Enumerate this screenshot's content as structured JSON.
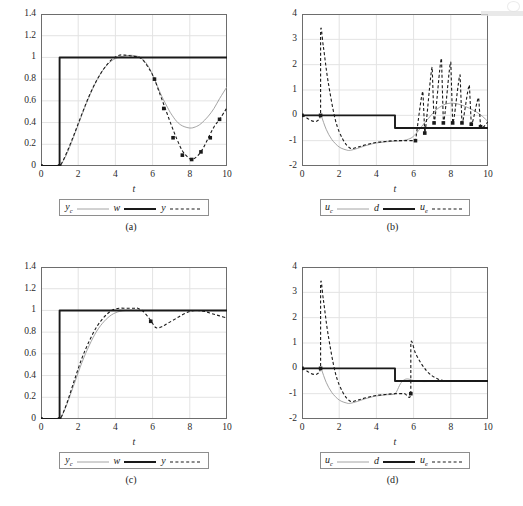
{
  "figure": {
    "panels": [
      {
        "caption": "(a)",
        "xlabel": "t",
        "legend": [
          {
            "label": "y",
            "sub": "c",
            "style": "thin-gray-solid"
          },
          {
            "label": "w",
            "sub": "",
            "style": "thick-black-solid"
          },
          {
            "label": "y",
            "sub": "",
            "style": "black-dashed"
          }
        ]
      },
      {
        "caption": "(b)",
        "xlabel": "t",
        "legend": [
          {
            "label": "u",
            "sub": "c",
            "style": "thin-gray-solid"
          },
          {
            "label": "d",
            "sub": "",
            "style": "thick-black-solid"
          },
          {
            "label": "u",
            "sub": "e",
            "style": "black-dashed"
          }
        ]
      },
      {
        "caption": "(c)",
        "xlabel": "t",
        "legend": [
          {
            "label": "y",
            "sub": "c",
            "style": "thin-gray-solid"
          },
          {
            "label": "w",
            "sub": "",
            "style": "thick-black-solid"
          },
          {
            "label": "y",
            "sub": "",
            "style": "black-dashed"
          }
        ]
      },
      {
        "caption": "(d)",
        "xlabel": "t",
        "legend": [
          {
            "label": "u",
            "sub": "c",
            "style": "thin-gray-solid"
          },
          {
            "label": "d",
            "sub": "",
            "style": "thick-black-solid"
          },
          {
            "label": "u",
            "sub": "e",
            "style": "black-dashed"
          }
        ]
      }
    ]
  },
  "colors": {
    "grid": "#e3e3e3",
    "frame": "#6d6d6d",
    "thin_gray": "#9a9a9a",
    "black": "#1a1a1a",
    "background": "#ffffff"
  },
  "chart_data": [
    {
      "type": "line",
      "panel": "(a)",
      "title": "",
      "xlabel": "t",
      "ylabel": "",
      "xlim": [
        0,
        10
      ],
      "ylim": [
        0,
        1.4
      ],
      "xticks": [
        0,
        2,
        4,
        6,
        8,
        10
      ],
      "yticks": [
        0,
        0.2,
        0.4,
        0.6,
        0.8,
        1,
        1.2,
        1.4
      ],
      "grid": true,
      "legend": [
        "y_c",
        "w",
        "y"
      ],
      "legend_position": "below-axes",
      "series": [
        {
          "name": "y_c",
          "style": "thin-gray-solid",
          "x": [
            0,
            0.5,
            1,
            1.05,
            1.3,
            1.6,
            2,
            2.4,
            2.8,
            3.2,
            3.6,
            4,
            4.4,
            4.8,
            5.2,
            5.4,
            5.6,
            5.8,
            6,
            6.2,
            6.5,
            6.8,
            7,
            7.3,
            7.6,
            8,
            8.3,
            8.6,
            9,
            9.3,
            9.6,
            10
          ],
          "y": [
            0,
            0,
            0,
            0.01,
            0.08,
            0.2,
            0.38,
            0.56,
            0.72,
            0.85,
            0.94,
            0.99,
            1.01,
            1.02,
            1.01,
            0.99,
            0.96,
            0.91,
            0.84,
            0.76,
            0.64,
            0.54,
            0.48,
            0.41,
            0.37,
            0.35,
            0.36,
            0.39,
            0.46,
            0.53,
            0.62,
            0.73
          ]
        },
        {
          "name": "w",
          "style": "thick-black-solid",
          "x": [
            0,
            1,
            1,
            10
          ],
          "y": [
            0,
            0,
            1,
            1
          ]
        },
        {
          "name": "y",
          "style": "black-dashed-markers",
          "x": [
            0,
            0.5,
            1,
            1.1,
            1.4,
            1.8,
            2.2,
            2.6,
            3,
            3.4,
            3.8,
            4.2,
            4.6,
            5,
            5.3,
            5.6,
            5.9,
            6.1,
            6.4,
            6.7,
            7,
            7.3,
            7.6,
            7.9,
            8.1,
            8.4,
            8.7,
            9,
            9.3,
            9.6,
            9.9,
            10
          ],
          "y": [
            0,
            0,
            0,
            0.02,
            0.13,
            0.3,
            0.48,
            0.65,
            0.79,
            0.9,
            0.98,
            1.02,
            1.02,
            1.01,
            1,
            0.95,
            0.87,
            0.8,
            0.66,
            0.52,
            0.38,
            0.25,
            0.14,
            0.08,
            0.06,
            0.09,
            0.16,
            0.26,
            0.36,
            0.43,
            0.51,
            0.54
          ]
        }
      ],
      "markers": {
        "series": "y",
        "shape": "square",
        "x": [
          0,
          1,
          6.1,
          6.6,
          7.1,
          7.6,
          8.1,
          8.6,
          9.1,
          9.6
        ],
        "y": [
          0,
          0,
          0.8,
          0.53,
          0.26,
          0.1,
          0.06,
          0.13,
          0.26,
          0.43
        ]
      }
    },
    {
      "type": "line",
      "panel": "(b)",
      "title": "",
      "xlabel": "t",
      "ylabel": "",
      "xlim": [
        0,
        10
      ],
      "ylim": [
        -2,
        4
      ],
      "xticks": [
        0,
        2,
        4,
        6,
        8,
        10
      ],
      "yticks": [
        -2,
        -1,
        0,
        1,
        2,
        3,
        4
      ],
      "grid": true,
      "legend": [
        "u_c",
        "d",
        "u_e"
      ],
      "legend_position": "below-axes",
      "series": [
        {
          "name": "u_c",
          "style": "thin-gray-solid",
          "x": [
            0,
            1,
            1.05,
            1.3,
            1.6,
            2,
            2.4,
            2.6,
            3,
            3.4,
            3.8,
            4.2,
            4.6,
            5,
            5.4,
            5.8,
            6,
            6.2,
            6.5,
            6.8,
            7.1,
            7.4,
            7.7,
            8,
            8.3,
            8.6,
            9,
            9.4,
            9.7,
            10
          ],
          "y": [
            0,
            0,
            -0.05,
            -0.55,
            -0.95,
            -1.25,
            -1.37,
            -1.38,
            -1.3,
            -1.2,
            -1.12,
            -1.07,
            -1.04,
            -1.02,
            -1.0,
            -0.92,
            -0.82,
            -0.66,
            -0.38,
            -0.12,
            0.14,
            0.32,
            0.44,
            0.48,
            0.46,
            0.4,
            0.28,
            0.12,
            -0.04,
            -0.25
          ]
        },
        {
          "name": "d",
          "style": "thick-black-solid",
          "x": [
            0,
            5,
            5,
            10
          ],
          "y": [
            0,
            0,
            -0.5,
            -0.5
          ]
        },
        {
          "name": "u_e",
          "style": "black-dashed-markers",
          "x": [
            0,
            1,
            1,
            1.15,
            1.4,
            1.8,
            2.2,
            2.6,
            3,
            3.5,
            4,
            4.5,
            5,
            5.5,
            6,
            6.1,
            6.5,
            6.6,
            7.0,
            7.1,
            7.5,
            7.6,
            8.0,
            8.1,
            8.5,
            8.6,
            9.0,
            9.1,
            9.5,
            9.6,
            10
          ],
          "y": [
            0,
            0,
            3.3,
            2.7,
            1.35,
            -0.2,
            -0.95,
            -1.3,
            -1.25,
            -1.15,
            -1.07,
            -1.03,
            -1.0,
            -1.0,
            -1.0,
            -1.0,
            0.95,
            -0.7,
            1.9,
            -0.3,
            2.25,
            -0.3,
            2.1,
            -0.3,
            1.6,
            -0.3,
            1.2,
            -0.35,
            0.7,
            -0.45,
            -0.25
          ]
        }
      ],
      "markers": {
        "series": "u_e",
        "shape": "square",
        "x": [
          0,
          1,
          6.1,
          6.6,
          7.1,
          7.6,
          8.1,
          8.6,
          9.1,
          9.6
        ],
        "y": [
          0,
          0,
          -1.0,
          -0.7,
          -0.3,
          -0.3,
          -0.3,
          -0.3,
          -0.35,
          -0.45
        ]
      },
      "annotation": "sawtooth spikes in u_e after t = 6.5"
    },
    {
      "type": "line",
      "panel": "(c)",
      "title": "",
      "xlabel": "t",
      "ylabel": "",
      "xlim": [
        0,
        10
      ],
      "ylim": [
        0,
        1.4
      ],
      "xticks": [
        0,
        2,
        4,
        6,
        8,
        10
      ],
      "yticks": [
        0,
        0.2,
        0.4,
        0.6,
        0.8,
        1,
        1.2,
        1.4
      ],
      "grid": true,
      "legend": [
        "y_c",
        "w",
        "y"
      ],
      "legend_position": "below-axes",
      "series": [
        {
          "name": "y_c",
          "style": "thin-gray-solid",
          "x": [
            0,
            1,
            1.1,
            1.4,
            1.8,
            2.2,
            2.6,
            3,
            3.4,
            3.8,
            4.2,
            4.6,
            5,
            5.4,
            5.8,
            6.2,
            6.6,
            7,
            8,
            9,
            10
          ],
          "y": [
            0,
            0,
            0.02,
            0.14,
            0.33,
            0.52,
            0.68,
            0.81,
            0.9,
            0.96,
            0.99,
            1.0,
            1.0,
            1.0,
            1.0,
            1.0,
            1.0,
            1.0,
            1.0,
            1.0,
            1.0
          ]
        },
        {
          "name": "w",
          "style": "thick-black-solid",
          "x": [
            0,
            1,
            1,
            10
          ],
          "y": [
            0,
            0,
            1,
            1
          ]
        },
        {
          "name": "y",
          "style": "black-dashed-markers",
          "x": [
            0,
            1,
            1.1,
            1.4,
            1.8,
            2.2,
            2.6,
            3,
            3.4,
            3.8,
            4.2,
            4.6,
            5,
            5.2,
            5.5,
            5.8,
            6,
            6.2,
            6.5,
            6.8,
            7.2,
            7.6,
            8,
            8.4,
            8.8,
            9.2,
            9.6,
            10
          ],
          "y": [
            0,
            0,
            0.02,
            0.15,
            0.36,
            0.56,
            0.72,
            0.85,
            0.94,
            1.0,
            1.02,
            1.02,
            1.02,
            1.02,
            0.99,
            0.93,
            0.88,
            0.84,
            0.85,
            0.88,
            0.92,
            0.96,
            0.99,
            1.0,
            0.99,
            0.97,
            0.95,
            0.93
          ]
        }
      ],
      "markers": {
        "series": "y",
        "shape": "square",
        "x": [
          0,
          1,
          5.9
        ],
        "y": [
          0,
          0,
          0.9
        ]
      }
    },
    {
      "type": "line",
      "panel": "(d)",
      "title": "",
      "xlabel": "t",
      "ylabel": "",
      "xlim": [
        0,
        10
      ],
      "ylim": [
        -2,
        4
      ],
      "xticks": [
        0,
        2,
        4,
        6,
        8,
        10
      ],
      "yticks": [
        -2,
        -1,
        0,
        1,
        2,
        3,
        4
      ],
      "grid": true,
      "legend": [
        "u_c",
        "d",
        "u_e"
      ],
      "legend_position": "below-axes",
      "series": [
        {
          "name": "u_c",
          "style": "thin-gray-solid",
          "x": [
            0,
            1,
            1.05,
            1.3,
            1.6,
            2,
            2.4,
            2.6,
            3,
            3.4,
            3.8,
            4.2,
            4.6,
            5,
            5.1,
            5.3,
            5.5,
            5.7,
            5.9,
            6.1,
            6.4,
            6.8,
            7.2,
            7.6,
            8,
            9,
            10
          ],
          "y": [
            0,
            0,
            -0.05,
            -0.55,
            -0.95,
            -1.25,
            -1.37,
            -1.38,
            -1.3,
            -1.2,
            -1.12,
            -1.07,
            -1.04,
            -1.02,
            -0.9,
            -0.6,
            -0.45,
            -0.42,
            -0.46,
            -0.5,
            -0.52,
            -0.52,
            -0.51,
            -0.5,
            -0.5,
            -0.5,
            -0.5
          ]
        },
        {
          "name": "d",
          "style": "thick-black-solid",
          "x": [
            0,
            5,
            5,
            10
          ],
          "y": [
            0,
            0,
            -0.5,
            -0.5
          ]
        },
        {
          "name": "u_e",
          "style": "black-dashed-markers",
          "x": [
            0,
            1,
            1,
            1.15,
            1.4,
            1.8,
            2.2,
            2.6,
            3,
            3.5,
            4,
            4.5,
            5,
            5.5,
            5.85,
            5.85,
            6.1,
            6.4,
            6.7,
            7,
            7.3,
            7.6,
            8,
            8.5,
            9,
            9.5,
            10
          ],
          "y": [
            0,
            0,
            3.3,
            2.7,
            1.35,
            -0.2,
            -0.95,
            -1.3,
            -1.25,
            -1.15,
            -1.07,
            -1.03,
            -1.0,
            -1.0,
            -1.0,
            1.0,
            0.6,
            0.2,
            -0.1,
            -0.3,
            -0.42,
            -0.48,
            -0.5,
            -0.5,
            -0.5,
            -0.5,
            -0.5
          ]
        }
      ],
      "markers": {
        "series": "u_e",
        "shape": "square",
        "x": [
          0,
          1,
          5.85
        ],
        "y": [
          0,
          0,
          -1.0
        ]
      }
    }
  ]
}
